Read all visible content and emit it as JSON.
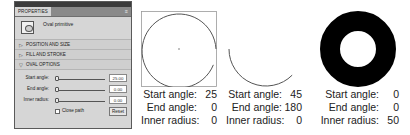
{
  "panel": {
    "tab_label": "PROPERTIES",
    "menu_glyph": "≡",
    "primitive_label": "Oval primitive",
    "sections": [
      {
        "label": "POSITION AND SIZE",
        "expanded": false
      },
      {
        "label": "FILL AND STROKE",
        "expanded": false
      },
      {
        "label": "OVAL OPTIONS",
        "expanded": true
      }
    ],
    "oval_options": {
      "start_angle": {
        "label": "Start angle:",
        "value": "25.00"
      },
      "end_angle": {
        "label": "End angle:",
        "value": "0.00"
      },
      "inner_radius": {
        "label": "Inner radius:",
        "value": "0.00"
      },
      "close_path_label": "Close path",
      "close_path_checked": false,
      "reset_label": "Reset"
    }
  },
  "examples": [
    {
      "start_label": "Start angle:",
      "start": "25",
      "end_label": "End angle:",
      "end": "0",
      "inner_label": "Inner radius:",
      "inner": "0"
    },
    {
      "start_label": "Start angle:",
      "start": "45",
      "end_label": "End angle:",
      "end": "180",
      "inner_label": "Inner radius:",
      "inner": "0"
    },
    {
      "start_label": "Start angle:",
      "start": "0",
      "end_label": "End angle:",
      "end": "0",
      "inner_label": "Inner radius:",
      "inner": "50"
    }
  ],
  "colors": {
    "panel_bg": "#d6d6d6",
    "titlebar": "#3c3c3c",
    "tabbar": "#8a8a8a",
    "stroke": "#555555",
    "ring": "#000000"
  }
}
